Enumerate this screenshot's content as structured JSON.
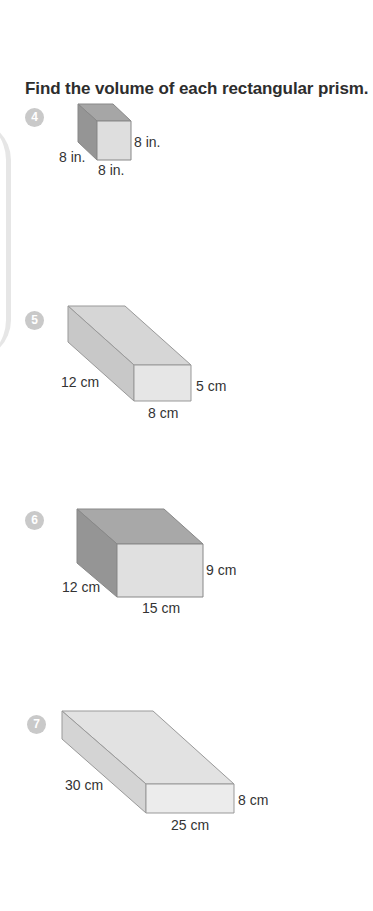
{
  "title": "Find the volume of each rectangular prism.",
  "problems": [
    {
      "number": "4",
      "shape": "rectangular-prism",
      "dimensions": {
        "depth": "8 in.",
        "height": "8 in.",
        "width": "8 in."
      },
      "labels": {
        "height": "8 in.",
        "depth": "8 in.",
        "width": "8 in."
      }
    },
    {
      "number": "5",
      "shape": "rectangular-prism",
      "dimensions": {
        "depth": "12 cm",
        "height": "5 cm",
        "width": "8 cm"
      },
      "labels": {
        "depth": "12 cm",
        "height": "5 cm",
        "width": "8 cm"
      }
    },
    {
      "number": "6",
      "shape": "rectangular-prism",
      "dimensions": {
        "depth": "12 cm",
        "height": "9 cm",
        "width": "15 cm"
      },
      "labels": {
        "height": "9 cm",
        "depth": "12 cm",
        "width": "15 cm"
      }
    },
    {
      "number": "7",
      "shape": "rectangular-prism",
      "dimensions": {
        "depth": "30 cm",
        "height": "8 cm",
        "width": "25 cm"
      },
      "labels": {
        "depth": "30 cm",
        "height": "8 cm",
        "width": "25 cm"
      }
    }
  ],
  "colors": {
    "badge": "#c9c9c9",
    "face_top_dark": "#a9a9a9",
    "face_side_dark": "#9a9a9a",
    "face_front": "#e0e0e0",
    "face_top_light": "#dcdcdc",
    "face_side_light": "#cfcfcf",
    "edge": "#8c8c8c"
  }
}
